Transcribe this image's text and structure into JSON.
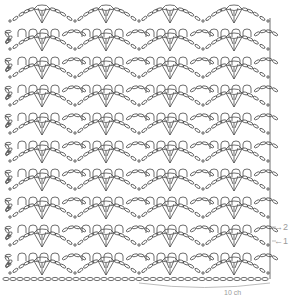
{
  "diagram": {
    "type": "crochet-chart",
    "stroke_color": "#4a4a4a",
    "light_color": "#aaaaaa",
    "shell_rows": 10,
    "picot_rows": 9,
    "row_period": 28,
    "first_shell_center_y": 14,
    "repeat_width": 64,
    "shell_centers_x": [
      42,
      106,
      170,
      234
    ],
    "sc_marks_x": [
      10,
      75,
      139,
      203
    ],
    "left_edge_x": 8,
    "right_edge_x": 270,
    "foundation_y": 279,
    "foundation_chain_count": 38,
    "row_labels": [
      {
        "id": "row2",
        "text": "→2"
      },
      {
        "id": "row1",
        "text": "←1"
      }
    ],
    "repeat_label": "10 ch"
  }
}
